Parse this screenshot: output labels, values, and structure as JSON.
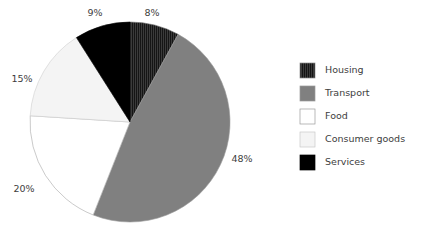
{
  "chart_data": {
    "type": "pie",
    "title": "",
    "categories": [
      "Housing",
      "Transport",
      "Food",
      "Consumer goods",
      "Services"
    ],
    "values": [
      8,
      48,
      20,
      15,
      9
    ],
    "value_labels": [
      "8%",
      "48%",
      "20%",
      "15%",
      "9%"
    ],
    "units": "percent",
    "start_angle_deg": 90,
    "direction": "clockwise",
    "legend_position": "right",
    "grid": false,
    "colors": [
      "#333333",
      "#808080",
      "#ffffff",
      "#f2f2f2",
      "#000000"
    ],
    "slice_patterns": [
      "vertical-hatch",
      "solid",
      "solid",
      "solid",
      "solid"
    ],
    "edge_color": "#999999",
    "background": "#ffffff",
    "label_color": "#3d3d3d"
  },
  "slices": [
    {
      "name": "Housing",
      "label": "8%",
      "value": 8,
      "color": "#333333",
      "pattern": "vertical-hatch",
      "label_x": 152,
      "label_y": 16
    },
    {
      "name": "Transport",
      "label": "48%",
      "value": 48,
      "color": "#808080",
      "pattern": "solid",
      "label_x": 242,
      "label_y": 162
    },
    {
      "name": "Food",
      "label": "20%",
      "value": 20,
      "color": "#ffffff",
      "pattern": "solid",
      "label_x": 24,
      "label_y": 192
    },
    {
      "name": "Consumer goods",
      "label": "15%",
      "value": 15,
      "color": "#f2f2f2",
      "pattern": "solid",
      "label_x": 22,
      "label_y": 82
    },
    {
      "name": "Services",
      "label": "9%",
      "value": 9,
      "color": "#000000",
      "pattern": "solid",
      "label_x": 95,
      "label_y": 16
    }
  ],
  "legend": {
    "items": [
      {
        "label": "Housing",
        "color": "#333333",
        "pattern": "vertical-hatch",
        "border": "#8c8c8c"
      },
      {
        "label": "Transport",
        "color": "#808080",
        "pattern": "solid",
        "border": "#9a9a9a"
      },
      {
        "label": "Food",
        "color": "#ffffff",
        "pattern": "solid",
        "border": "#9a9a9a"
      },
      {
        "label": "Consumer goods",
        "color": "#f2f2f2",
        "pattern": "solid",
        "border": "#c9c9c9"
      },
      {
        "label": "Services",
        "color": "#000000",
        "pattern": "solid",
        "border": "#000000"
      }
    ]
  },
  "geometry": {
    "center_x": 130,
    "center_y": 122,
    "radius": 100,
    "legend_swatch_x": 300,
    "legend_swatch_size": 15,
    "legend_text_x": 325,
    "legend_first_y": 63,
    "legend_row_step": 23
  }
}
